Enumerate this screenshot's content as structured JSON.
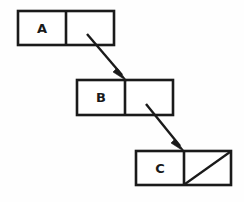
{
  "diagram": {
    "type": "linked-list",
    "title": "",
    "canvas": {
      "width": 244,
      "height": 202,
      "background": "#fefefe"
    },
    "stroke_color": "#1a1a1a",
    "fill_color": "#ffffff",
    "nodes": [
      {
        "id": "node-a",
        "label": "A",
        "x": 18,
        "y": 11,
        "width": 96,
        "height": 34,
        "divider_x": 66,
        "data_cell_label": "A",
        "pointer_cell_null": false
      },
      {
        "id": "node-b",
        "label": "B",
        "x": 77,
        "y": 80,
        "width": 96,
        "height": 35,
        "divider_x": 125,
        "data_cell_label": "B",
        "pointer_cell_null": false
      },
      {
        "id": "node-c",
        "label": "C",
        "x": 136,
        "y": 151,
        "width": 95,
        "height": 34,
        "divider_x": 184,
        "data_cell_label": "C",
        "pointer_cell_null": true
      }
    ],
    "pointers": [
      {
        "id": "pointer-a-to-b",
        "from": "node-a",
        "to": "node-b",
        "x1": 87,
        "y1": 34,
        "x2": 127,
        "y2": 81,
        "arrowhead": "filled-triangle"
      },
      {
        "id": "pointer-b-to-c",
        "from": "node-b",
        "to": "node-c",
        "x1": 146,
        "y1": 104,
        "x2": 185,
        "y2": 152,
        "arrowhead": "filled-triangle"
      }
    ],
    "null_marker": {
      "node": "node-c",
      "style": "diagonal-slash",
      "direction": "bottom-left-to-top-right"
    }
  }
}
